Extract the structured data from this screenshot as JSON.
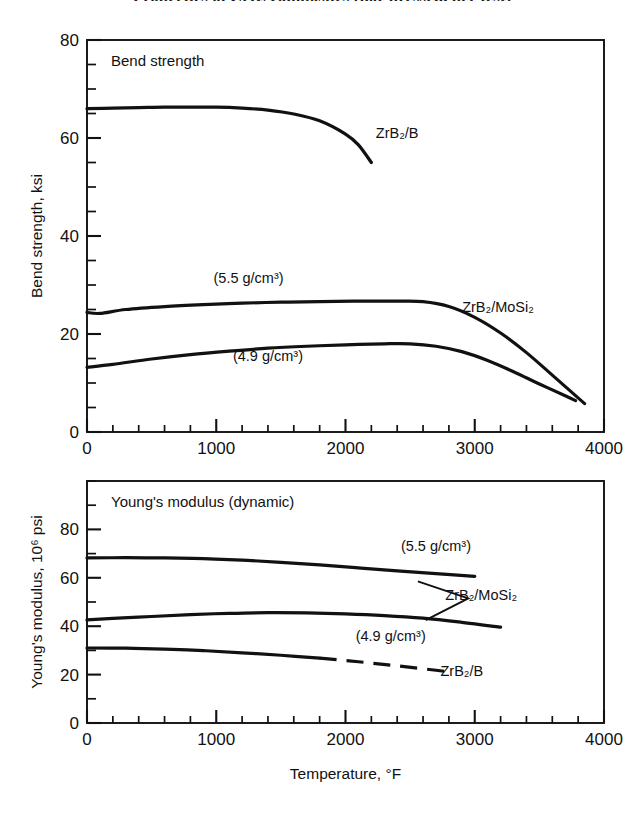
{
  "figure": {
    "clipped_title": "Properties of ZrB₂ composites (hot-pressed, per test)",
    "background_color": "#ffffff",
    "line_color": "#111111",
    "xlabel": "Temperature, °F"
  },
  "chart_data": [
    {
      "type": "line",
      "panel": "top",
      "title": "Bend strength",
      "xlabel": "Temperature, °F",
      "ylabel": "Bend strength, ksi",
      "xlim": [
        0,
        4000
      ],
      "ylim": [
        0,
        80
      ],
      "xticks": [
        0,
        1000,
        2000,
        3000,
        4000
      ],
      "xtick_labels": [
        "0",
        "1000",
        "2000",
        "3000",
        "4000"
      ],
      "yticks": [
        0,
        20,
        40,
        60,
        80
      ],
      "ytick_labels": [
        "0",
        "20",
        "40",
        "60",
        "80"
      ],
      "x_minor_step": 200,
      "y_minor_step": 5,
      "grid": false,
      "legend": "inline-annotations",
      "series": [
        {
          "name": "ZrB2/B",
          "label": "ZrB₂/B",
          "label_x": 2400,
          "label_y": 60,
          "style": "solid",
          "points": [
            [
              0,
              66.0
            ],
            [
              200,
              66.1
            ],
            [
              400,
              66.2
            ],
            [
              600,
              66.3
            ],
            [
              800,
              66.3
            ],
            [
              1000,
              66.3
            ],
            [
              1200,
              66.1
            ],
            [
              1400,
              65.7
            ],
            [
              1600,
              64.9
            ],
            [
              1800,
              63.5
            ],
            [
              2000,
              60.8
            ],
            [
              2100,
              58.6
            ],
            [
              2200,
              55.0
            ]
          ]
        },
        {
          "name": "ZrB2/MoSi2 5.5",
          "label": "(5.5 g/cm³)",
          "label_x": 1250,
          "label_y": 30.5,
          "style": "solid",
          "points": [
            [
              0,
              24.4
            ],
            [
              100,
              24.2
            ],
            [
              300,
              25.0
            ],
            [
              600,
              25.6
            ],
            [
              900,
              26.0
            ],
            [
              1200,
              26.3
            ],
            [
              1500,
              26.5
            ],
            [
              1800,
              26.6
            ],
            [
              2100,
              26.7
            ],
            [
              2400,
              26.7
            ],
            [
              2600,
              26.6
            ],
            [
              2800,
              25.6
            ],
            [
              3000,
              23.4
            ],
            [
              3200,
              20.2
            ],
            [
              3400,
              16.2
            ],
            [
              3600,
              11.6
            ],
            [
              3850,
              5.8
            ]
          ]
        },
        {
          "name": "ZrB2/MoSi2 4.9",
          "label": "(4.9 g/cm³)",
          "label_x": 1400,
          "label_y": 14.5,
          "style": "solid",
          "points": [
            [
              0,
              13.2
            ],
            [
              200,
              13.8
            ],
            [
              500,
              14.9
            ],
            [
              800,
              15.8
            ],
            [
              1100,
              16.5
            ],
            [
              1400,
              17.1
            ],
            [
              1700,
              17.5
            ],
            [
              2000,
              17.8
            ],
            [
              2300,
              18.0
            ],
            [
              2500,
              18.0
            ],
            [
              2700,
              17.5
            ],
            [
              2900,
              16.4
            ],
            [
              3100,
              14.6
            ],
            [
              3300,
              12.3
            ],
            [
              3500,
              9.8
            ],
            [
              3700,
              7.4
            ],
            [
              3780,
              6.4
            ]
          ]
        }
      ],
      "annotations": [
        {
          "text": "ZrB₂/MoSi₂",
          "x": 3180,
          "y": 24.5
        }
      ]
    },
    {
      "type": "line",
      "panel": "bottom",
      "title": "Young's modulus (dynamic)",
      "xlabel": "Temperature, °F",
      "ylabel": "Young's modulus, 10⁶ psi",
      "xlim": [
        0,
        4000
      ],
      "ylim": [
        0,
        100
      ],
      "xticks": [
        0,
        1000,
        2000,
        3000,
        4000
      ],
      "xtick_labels": [
        "0",
        "1000",
        "2000",
        "3000",
        "4000"
      ],
      "yticks": [
        0,
        20,
        40,
        60,
        80
      ],
      "ytick_labels": [
        "0",
        "20",
        "40",
        "60",
        "80"
      ],
      "x_minor_step": 200,
      "y_minor_step": 10,
      "grid": false,
      "legend": "inline-annotations",
      "series": [
        {
          "name": "ZrB2/MoSi2 5.5",
          "label": "(5.5 g/cm³)",
          "label_x": 2700,
          "label_y": 71.0,
          "style": "solid",
          "points": [
            [
              0,
              68.2
            ],
            [
              300,
              68.3
            ],
            [
              600,
              68.2
            ],
            [
              900,
              67.9
            ],
            [
              1200,
              67.3
            ],
            [
              1500,
              66.4
            ],
            [
              1800,
              65.3
            ],
            [
              2100,
              64.1
            ],
            [
              2400,
              62.9
            ],
            [
              2700,
              61.7
            ],
            [
              3000,
              60.6
            ]
          ]
        },
        {
          "name": "ZrB2/MoSi2 4.9",
          "label": "(4.9 g/cm³)",
          "label_x": 2350,
          "label_y": 34.0,
          "style": "solid",
          "points": [
            [
              0,
              42.6
            ],
            [
              200,
              43.2
            ],
            [
              500,
              44.0
            ],
            [
              800,
              44.8
            ],
            [
              1100,
              45.3
            ],
            [
              1400,
              45.6
            ],
            [
              1700,
              45.5
            ],
            [
              2000,
              45.1
            ],
            [
              2300,
              44.4
            ],
            [
              2600,
              43.3
            ],
            [
              2900,
              41.6
            ],
            [
              3200,
              39.6
            ]
          ]
        },
        {
          "name": "ZrB2/B",
          "label": "ZrB₂/B",
          "label_x": 2900,
          "label_y": 19.5,
          "style": "solid-then-dashed",
          "dash_start_x": 1800,
          "points": [
            [
              0,
              31.0
            ],
            [
              300,
              30.9
            ],
            [
              600,
              30.5
            ],
            [
              900,
              29.9
            ],
            [
              1200,
              29.0
            ],
            [
              1500,
              28.0
            ],
            [
              1800,
              26.8
            ],
            [
              2100,
              25.3
            ],
            [
              2400,
              23.6
            ],
            [
              2700,
              21.8
            ],
            [
              2820,
              21.0
            ]
          ]
        }
      ],
      "annotations": [
        {
          "text": "ZrB₂/MoSi₂",
          "x": 3050,
          "y": 51.0
        }
      ]
    }
  ]
}
